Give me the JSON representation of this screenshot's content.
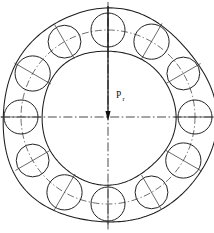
{
  "figure": {
    "background_color": "#ffffff",
    "line_color": "#1d1d1d",
    "width": 214,
    "height": 233
  },
  "annotations": {
    "load_symbol": "P",
    "load_subscript": "r",
    "load_full": "Pr",
    "load_direction": "downward"
  },
  "chart_data": {
    "type": "diagram",
    "center": {
      "x": 108,
      "y": 117
    },
    "geometry": {
      "outer_ring_radius": 107,
      "inner_ring_radius": 67,
      "pitch_circle_radius": 87,
      "ball_radius": 17,
      "ball_count": 12,
      "ball_angular_pitch_deg": 30,
      "first_ball_angle_deg": 90
    },
    "balls": [
      {
        "index": 1,
        "angle_deg": 90,
        "position": "top",
        "cx": 108,
        "cy": 30
      },
      {
        "index": 2,
        "angle_deg": 60,
        "position": "upper-right",
        "cx": 151.5,
        "cy": 41.7
      },
      {
        "index": 3,
        "angle_deg": 30,
        "position": "right-upper",
        "cx": 183.3,
        "cy": 73.5
      },
      {
        "index": 4,
        "angle_deg": 0,
        "position": "right",
        "cx": 195,
        "cy": 117
      },
      {
        "index": 5,
        "angle_deg": 330,
        "position": "right-lower",
        "cx": 183.3,
        "cy": 160.5
      },
      {
        "index": 6,
        "angle_deg": 300,
        "position": "lower-right",
        "cx": 151.5,
        "cy": 192.3
      },
      {
        "index": 7,
        "angle_deg": 270,
        "position": "bottom",
        "cx": 108,
        "cy": 204
      },
      {
        "index": 8,
        "angle_deg": 240,
        "position": "lower-left",
        "cx": 64.5,
        "cy": 192.3
      },
      {
        "index": 9,
        "angle_deg": 210,
        "position": "left-lower",
        "cx": 32.7,
        "cy": 160.5
      },
      {
        "index": 10,
        "angle_deg": 180,
        "position": "left",
        "cx": 21,
        "cy": 117
      },
      {
        "index": 11,
        "angle_deg": 150,
        "position": "left-upper",
        "cx": 32.7,
        "cy": 73.5
      },
      {
        "index": 12,
        "angle_deg": 120,
        "position": "upper-left",
        "cx": 64.5,
        "cy": 41.7
      }
    ],
    "load_arrow": {
      "label": "Pr",
      "from": {
        "x": 108,
        "y": 6
      },
      "to": {
        "x": 108,
        "y": 121
      },
      "direction": "down"
    },
    "centerlines": [
      {
        "name": "vertical-centerline",
        "orientation": "vertical",
        "style": "dash-dot"
      },
      {
        "name": "horizontal-centerline",
        "orientation": "horizontal",
        "style": "dash-dot"
      }
    ],
    "legend": [],
    "grid": false
  }
}
